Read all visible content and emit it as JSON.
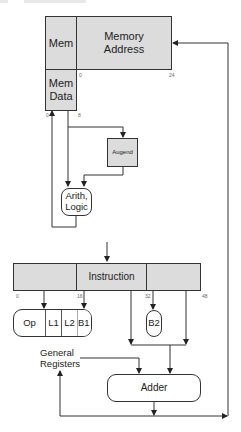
{
  "diagram": {
    "memory": {
      "mem_label": "Mem",
      "address_label": "Memory Address",
      "address_line1": "Memory",
      "address_line2": "Address",
      "data_line1": "Mem",
      "data_line2": "Data",
      "ticks": {
        "addr_start": "0",
        "addr_end": "24",
        "data_start": "0",
        "data_end": "8"
      }
    },
    "augend": {
      "label": "Augend"
    },
    "arith_logic": {
      "line1": "Arith,",
      "line2": "Logic"
    },
    "instruction": {
      "label": "Instruction",
      "ticks": {
        "t0": "0",
        "t16": "16",
        "t32": "32",
        "t48": "48"
      }
    },
    "fields": {
      "op": "Op",
      "l1": "L1",
      "l2": "L2",
      "b1": "B1",
      "b2": "B2"
    },
    "general_registers": {
      "line1": "General",
      "line2": "Registers"
    },
    "adder": {
      "label": "Adder"
    },
    "colors": {
      "box_fill": "#dcdcdc",
      "line": "#333333"
    }
  }
}
